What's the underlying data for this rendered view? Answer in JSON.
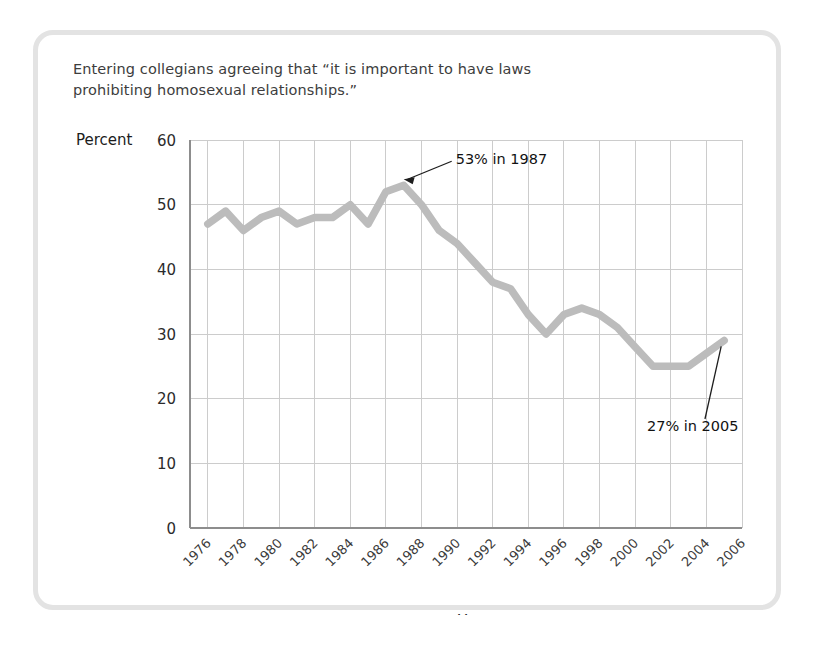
{
  "caption": {
    "line1": "Entering collegians agreeing that “it is important to have laws",
    "line2": "prohibiting homosexual relationships.”"
  },
  "axis": {
    "y_label": "Percent",
    "x_label": "Year"
  },
  "colors": {
    "series": "#bcbcbc",
    "grid": "#cccccc",
    "axis": "#8d8d8d",
    "card_border": "#e3e3e3",
    "text": "#1c1c1c",
    "caption_text": "#3d3d3d"
  },
  "annotations": [
    {
      "name": "peak-annotation",
      "text": "53% in 1987",
      "year": 1987,
      "value": 53
    },
    {
      "name": "end-annotation",
      "text": "27% in 2005",
      "year": 2005,
      "value": 27
    }
  ],
  "chart_data": {
    "type": "line",
    "title": "Entering collegians agreeing that “it is important to have laws prohibiting homosexual relationships.”",
    "xlabel": "Year",
    "ylabel": "Percent",
    "xlim": [
      1975,
      2006
    ],
    "ylim": [
      0,
      60
    ],
    "ytick_values": [
      0,
      10,
      20,
      30,
      40,
      50,
      60
    ],
    "ytick_labels": [
      "0",
      "10",
      "20",
      "30",
      "40",
      "50",
      "60"
    ],
    "xtick_values": [
      1976,
      1978,
      1980,
      1982,
      1984,
      1986,
      1988,
      1990,
      1992,
      1994,
      1996,
      1998,
      2000,
      2002,
      2004,
      2006
    ],
    "xtick_labels": [
      "1976",
      "1978",
      "1980",
      "1982",
      "1984",
      "1986",
      "1988",
      "1990",
      "1992",
      "1994",
      "1996",
      "1998",
      "2000",
      "2002",
      "2004",
      "2006"
    ],
    "xtick_rotation": 45,
    "grid": true,
    "legend": false,
    "series": [
      {
        "name": "Percent agreeing",
        "color": "#bcbcbc",
        "x": [
          1976,
          1977,
          1978,
          1979,
          1980,
          1981,
          1982,
          1983,
          1984,
          1985,
          1986,
          1987,
          1988,
          1989,
          1990,
          1991,
          1992,
          1993,
          1994,
          1995,
          1996,
          1997,
          1998,
          1999,
          2000,
          2001,
          2002,
          2003,
          2004,
          2005
        ],
        "y": [
          47,
          49,
          46,
          48,
          49,
          47,
          48,
          48,
          50,
          47,
          52,
          53,
          50,
          46,
          44,
          41,
          38,
          37,
          33,
          30,
          33,
          34,
          33,
          31,
          28,
          25,
          25,
          25,
          27,
          29
        ]
      }
    ]
  }
}
